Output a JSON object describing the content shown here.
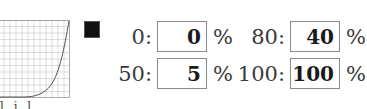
{
  "curve": {
    "description": "gamma/tone curve preview",
    "grid_divisions": 12,
    "points": [
      [
        0,
        0
      ],
      [
        25,
        0
      ],
      [
        50,
        5
      ],
      [
        80,
        40
      ],
      [
        100,
        100
      ]
    ]
  },
  "swatch": {
    "color": "#111111"
  },
  "fields": [
    {
      "label": "0:",
      "value": "0",
      "unit": "%"
    },
    {
      "label": "50:",
      "value": "5",
      "unit": "%"
    },
    {
      "label": "80:",
      "value": "40",
      "unit": "%"
    },
    {
      "label": "100:",
      "value": "100",
      "unit": "%"
    }
  ],
  "bottom_text": "l i l ."
}
